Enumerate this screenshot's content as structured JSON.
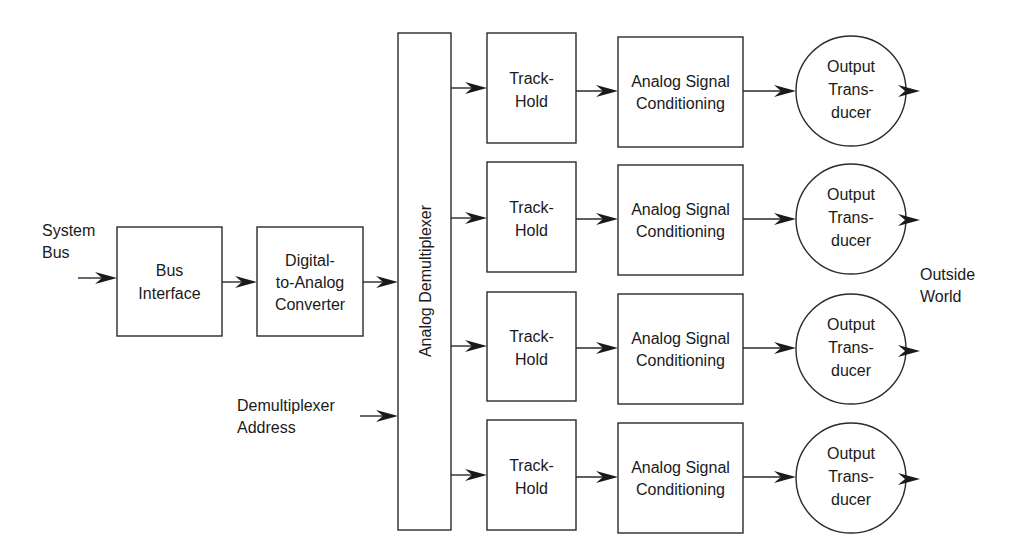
{
  "diagram": {
    "inputs": {
      "system_bus": [
        "System",
        "Bus"
      ],
      "demux_address": [
        "Demultiplexer",
        "Address"
      ]
    },
    "blocks": {
      "bus_interface": [
        "Bus",
        "Interface"
      ],
      "dac": [
        "Digital-",
        "to-Analog",
        "Converter"
      ],
      "demux": "Analog Demultiplexer"
    },
    "channels": [
      {
        "track_hold": [
          "Track-",
          "Hold"
        ],
        "conditioning": [
          "Analog Signal",
          "Conditioning"
        ],
        "transducer": [
          "Output",
          "Trans-",
          "ducer"
        ]
      },
      {
        "track_hold": [
          "Track-",
          "Hold"
        ],
        "conditioning": [
          "Analog Signal",
          "Conditioning"
        ],
        "transducer": [
          "Output",
          "Trans-",
          "ducer"
        ]
      },
      {
        "track_hold": [
          "Track-",
          "Hold"
        ],
        "conditioning": [
          "Analog Signal",
          "Conditioning"
        ],
        "transducer": [
          "Output",
          "Trans-",
          "ducer"
        ]
      },
      {
        "track_hold": [
          "Track-",
          "Hold"
        ],
        "conditioning": [
          "Analog Signal",
          "Conditioning"
        ],
        "transducer": [
          "Output",
          "Trans-",
          "ducer"
        ]
      }
    ],
    "output_label": [
      "Outside",
      "World"
    ]
  }
}
